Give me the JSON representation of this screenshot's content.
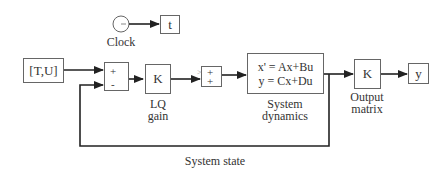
{
  "diagram": {
    "type": "simulink-block-diagram",
    "blocks": {
      "clock": {
        "label": "Clock",
        "icon": "clock-icon"
      },
      "t_out": {
        "text": "t"
      },
      "input": {
        "text": "[T,U]"
      },
      "sum1": {
        "sign_top": "+",
        "sign_bottom": "-"
      },
      "lq_gain": {
        "text": "K",
        "label_line1": "LQ",
        "label_line2": "gain"
      },
      "sum2": {
        "sign_top": "+",
        "sign_bottom": "+",
        "marker": ">"
      },
      "system_dynamics": {
        "eq1": "x' = Ax+Bu",
        "eq2": "y = Cx+Du",
        "label_line1": "System",
        "label_line2": "dynamics"
      },
      "output_matrix": {
        "text": "K",
        "label_line1": "Output",
        "label_line2": "matrix"
      },
      "y_out": {
        "text": "y"
      }
    },
    "feedback_label": "System state",
    "colors": {
      "line": "#222222",
      "border": "#666666",
      "text": "#333333",
      "background": "#ffffff"
    }
  }
}
